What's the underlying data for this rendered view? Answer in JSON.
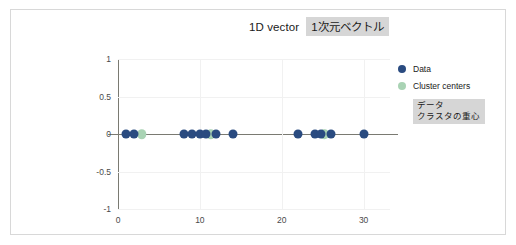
{
  "title": {
    "english": "1D vector",
    "japanese": "1次元ベクトル"
  },
  "legend": {
    "items": [
      {
        "label": "Data",
        "swatch": "data-dot-icon",
        "color": "#2a4b80"
      },
      {
        "label": "Cluster centers",
        "swatch": "cluster-center-dot-icon",
        "color": "#a9d3b4"
      }
    ],
    "note_lines": [
      "データ",
      "クラスタの重心"
    ]
  },
  "chart_data": {
    "type": "scatter",
    "title": "1D vector",
    "xlabel": "",
    "ylabel": "",
    "xlim": [
      -1,
      32
    ],
    "ylim": [
      -1,
      1
    ],
    "xticks": [
      0,
      10,
      20,
      30
    ],
    "yticks": [
      1,
      0.5,
      0,
      -0.5,
      -1
    ],
    "xtick_labels": [
      "0",
      "10",
      "20",
      "30"
    ],
    "ytick_labels": [
      "1",
      "0.5",
      "0",
      "-0.5",
      "-1"
    ],
    "grid": true,
    "legend_position": "right",
    "series": [
      {
        "name": "Data",
        "color": "#2a4b80",
        "x": [
          1.0,
          2.0,
          8.0,
          9.0,
          10.0,
          10.8,
          12.0,
          14.0,
          22.0,
          24.0,
          24.8,
          26.0,
          30.0
        ],
        "y": [
          0,
          0,
          0,
          0,
          0,
          0,
          0,
          0,
          0,
          0,
          0,
          0,
          0
        ]
      },
      {
        "name": "Cluster centers",
        "color": "#a9d3b4",
        "x": [
          2.9,
          11.3,
          25.2
        ],
        "y": [
          0,
          0,
          0
        ]
      }
    ]
  }
}
